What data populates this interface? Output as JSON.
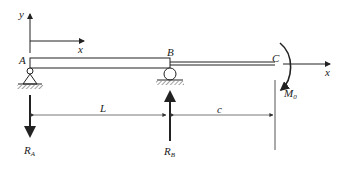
{
  "diagram": {
    "type": "beam-with-overhang",
    "colors": {
      "ink": "#222222",
      "dim": "#555555"
    },
    "axes": [
      {
        "id": "origin-axes",
        "x_label": "x",
        "y_label": "y"
      },
      {
        "id": "end-axis",
        "x_label": "x"
      }
    ],
    "points": {
      "a": "A",
      "b": "B",
      "c": "C"
    },
    "supports": [
      {
        "point": "A",
        "kind": "pin"
      },
      {
        "point": "B",
        "kind": "roller"
      }
    ],
    "reactions": {
      "ra": {
        "label": "R",
        "sub": "A",
        "direction": "down"
      },
      "rb": {
        "label": "R",
        "sub": "B",
        "direction": "up"
      }
    },
    "moment": {
      "label": "M",
      "sub": "0",
      "direction": "clockwise",
      "at": "C"
    },
    "dimensions": {
      "span": "L",
      "overhang": "c"
    }
  }
}
